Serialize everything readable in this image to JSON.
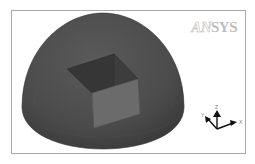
{
  "viewport": {
    "logo": {
      "prefix": "AN",
      "suffix": "SYS"
    },
    "model": {
      "description": "Hemispherical dome enclosing a rectangular box",
      "dome_color": "#4a4a4a",
      "box_top_color": "#3a3a3a",
      "box_front_color": "#6a6a6a"
    },
    "triad": {
      "labels": {
        "z": "Z",
        "y": "Y",
        "x": "X"
      },
      "arrow_color": "#111111"
    }
  }
}
